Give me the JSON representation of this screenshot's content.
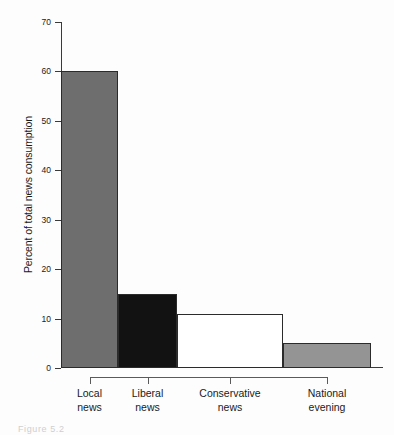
{
  "chart_data": {
    "type": "bar",
    "title": "",
    "subtitle": "",
    "xlabel": "",
    "ylabel": "Percent of total news consumption",
    "categories": [
      "Local news",
      "Liberal news",
      "Conservative news",
      "National evening"
    ],
    "category_lines": [
      [
        "Local",
        "news"
      ],
      [
        "Liberal",
        "news"
      ],
      [
        "Conservative",
        "news"
      ],
      [
        "National",
        "evening"
      ]
    ],
    "values": [
      60,
      15,
      11,
      5
    ],
    "bar_colors": [
      "#6e6e6e",
      "#121212",
      "#ffffff",
      "#949494"
    ],
    "bar_edge_color": "#2b2b2b",
    "bar_widths_px": [
      57,
      59,
      106,
      88
    ],
    "ylim": [
      0,
      70
    ],
    "yticks": [
      0,
      10,
      20,
      30,
      40,
      50,
      60,
      70
    ],
    "ytick_labels": [
      "0",
      "10",
      "20",
      "30",
      "40",
      "50",
      "60",
      "70"
    ],
    "grid": false,
    "legend": null,
    "legend_position": "none",
    "annotations": []
  },
  "caption": {
    "text": "Figure 5.2"
  }
}
